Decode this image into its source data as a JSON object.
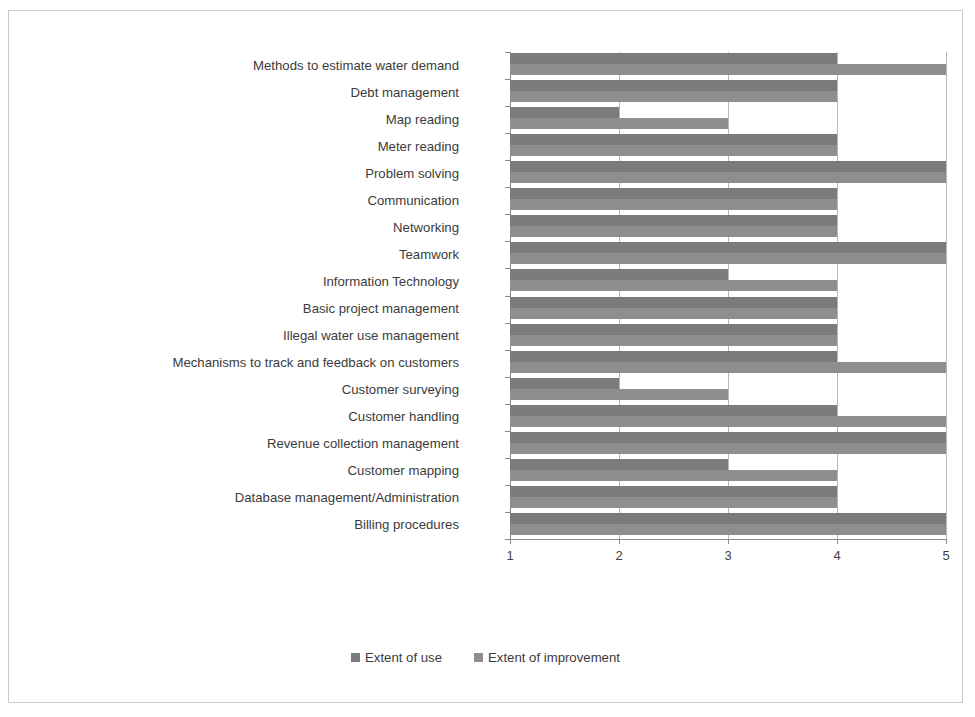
{
  "chart_data": {
    "type": "bar",
    "orientation": "horizontal",
    "title": "",
    "xlabel": "",
    "ylabel": "",
    "xlim": [
      1,
      5
    ],
    "xticks": [
      "1",
      "2",
      "3",
      "4",
      "5"
    ],
    "grid": true,
    "legend_position": "bottom",
    "categories": [
      "Methods to estimate water demand",
      "Debt management",
      "Map reading",
      "Meter reading",
      "Problem solving",
      "Communication",
      "Networking",
      "Teamwork",
      "Information Technology",
      "Basic project management",
      "Illegal water use management",
      "Mechanisms to track and feedback on customers",
      "Customer surveying",
      "Customer handling",
      "Revenue collection management",
      "Customer mapping",
      "Database management/Administration",
      "Billing procedures"
    ],
    "series": [
      {
        "name": "Extent of use",
        "color": "#7b7b7b",
        "values": [
          4,
          4,
          2,
          4,
          5,
          4,
          4,
          5,
          3,
          4,
          4,
          4,
          2,
          4,
          5,
          3,
          4,
          5
        ]
      },
      {
        "name": "Extent of improvement",
        "color": "#8e8e8e",
        "values": [
          5,
          4,
          3,
          4,
          5,
          4,
          4,
          5,
          4,
          4,
          4,
          5,
          3,
          5,
          5,
          4,
          4,
          5
        ]
      }
    ]
  },
  "legend": {
    "items": [
      {
        "label": "Extent of use",
        "color": "#7b7b7b"
      },
      {
        "label": "Extent of improvement",
        "color": "#8e8e8e"
      }
    ]
  }
}
